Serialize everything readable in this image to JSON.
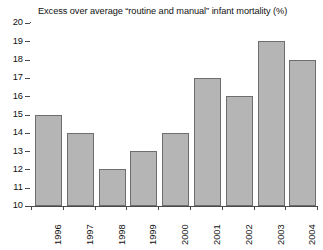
{
  "chart_data": {
    "type": "bar",
    "title": "Excess over average “routine and manual” infant mortality (%)",
    "xlabel": "",
    "ylabel": "",
    "categories": [
      "1996",
      "1997",
      "1998",
      "1999",
      "2000",
      "2001",
      "2002",
      "2003",
      "2004"
    ],
    "values": [
      15,
      14,
      12,
      13,
      14,
      17,
      16,
      19,
      18
    ],
    "ylim": [
      10,
      20
    ],
    "ytick_step": 1,
    "yticks": [
      "20",
      "19",
      "18",
      "17",
      "16",
      "15",
      "14",
      "13",
      "12",
      "11",
      "10"
    ],
    "grid": false,
    "legend": null,
    "series": [
      {
        "name": "Excess over average infant mortality",
        "values": [
          15,
          14,
          12,
          13,
          14,
          17,
          16,
          19,
          18
        ]
      }
    ],
    "colors": {
      "bar_fill": "#b5b5b5",
      "bar_border": "#6e6e6e",
      "axis": "#4a4a4a",
      "text": "#111111",
      "background": "#ffffff"
    }
  }
}
